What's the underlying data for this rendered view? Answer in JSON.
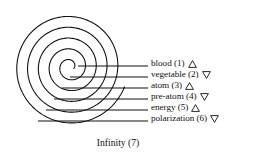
{
  "figure": {
    "caption": "Infinity (7)",
    "ink_color": "#111111",
    "background_color": "#ffffff"
  },
  "legend": {
    "items": [
      {
        "label": "blood (1)",
        "marker": "triangle-up-icon"
      },
      {
        "label": "vegetable (2)",
        "marker": "triangle-down-icon"
      },
      {
        "label": "atom (3)",
        "marker": "triangle-up-icon"
      },
      {
        "label": "pre-atom (4)",
        "marker": "triangle-down-icon"
      },
      {
        "label": "energy (5)",
        "marker": "triangle-up-icon"
      },
      {
        "label": "polarization (6)",
        "marker": "triangle-down-icon"
      }
    ]
  },
  "chart_data": {
    "type": "diagram",
    "title": "Infinity (7)",
    "subtitle": "",
    "xlabel": "",
    "ylabel": "",
    "spiral": {
      "center_x": 70,
      "center_y": 67,
      "turns": 5,
      "start_angle_deg": 0,
      "inner_radius": 4,
      "outer_radius": 58,
      "stroke_width": 1.1,
      "color": "#111111"
    },
    "categories": [
      "blood (1)",
      "vegetable (2)",
      "atom (3)",
      "pre-atom (4)",
      "energy (5)",
      "polarization (6)"
    ],
    "values": [
      1,
      2,
      3,
      4,
      5,
      6
    ],
    "markers": [
      "triangle-up-icon",
      "triangle-down-icon",
      "triangle-up-icon",
      "triangle-down-icon",
      "triangle-up-icon",
      "triangle-down-icon"
    ],
    "leader_lines": [
      {
        "label": "blood (1)",
        "x_start": 78,
        "x_end": 148,
        "y": 66
      },
      {
        "label": "vegetable (2)",
        "x_start": 70,
        "x_end": 148,
        "y": 77
      },
      {
        "label": "atom (3)",
        "x_start": 62,
        "x_end": 148,
        "y": 88
      },
      {
        "label": "pre-atom (4)",
        "x_start": 54,
        "x_end": 148,
        "y": 99
      },
      {
        "label": "energy (5)",
        "x_start": 46,
        "x_end": 148,
        "y": 110
      },
      {
        "label": "polarization (6)",
        "x_start": 38,
        "x_end": 148,
        "y": 121
      }
    ],
    "grid": false,
    "legend_position": "right"
  }
}
